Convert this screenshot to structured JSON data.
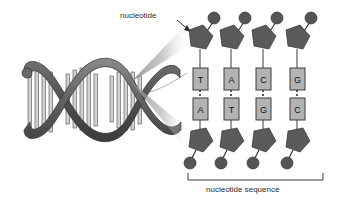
{
  "figure": {
    "background_color": "#ffffff",
    "labels": {
      "nucleotide": "nucleotide",
      "nucleotide_sequence": "nucleotide sequence"
    },
    "colors": {
      "sugar_pentagon": "#5a5a5a",
      "phosphate_circle": "#555555",
      "base_box": "#b3b3b3",
      "base_box_border": "#3d3d3d",
      "helix_ribbon": "#6e6e6e",
      "helix_ribbon_dark": "#4a4a4a",
      "rung": "#cfcfcf",
      "outline": "#2b2b2b",
      "text": "#2b2b2b",
      "wedge": "#8a8a8a"
    },
    "base_pairs": [
      {
        "index": 1,
        "top_base": "T",
        "bottom_base": "A"
      },
      {
        "index": 2,
        "top_base": "A",
        "bottom_base": "T"
      },
      {
        "index": 3,
        "top_base": "C",
        "bottom_base": "G"
      },
      {
        "index": 4,
        "top_base": "G",
        "bottom_base": "C"
      }
    ],
    "helix": {
      "turns": 3,
      "rungs_per_turn": 5
    },
    "parts": {
      "sugar": "pentagon",
      "phosphate": "circle",
      "base": "rectangle"
    }
  }
}
